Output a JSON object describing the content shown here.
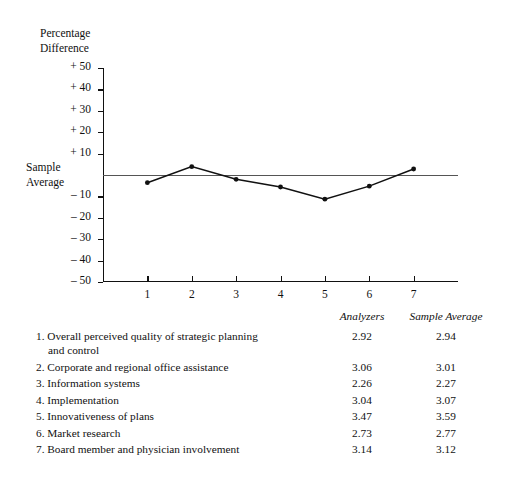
{
  "chart_data": {
    "type": "line",
    "title": "",
    "ylabel": "Percentage Difference",
    "xlabel": "",
    "zero_line_label": "Sample Average",
    "ylim": [
      -50,
      50
    ],
    "ytick_labels": [
      "+ 50",
      "+ 40",
      "+ 30",
      "+ 20",
      "+ 10",
      "– 10",
      "– 20",
      "– 30",
      "– 40",
      "– 50"
    ],
    "ytick_values": [
      50,
      40,
      30,
      20,
      10,
      -10,
      -20,
      -30,
      -40,
      -50
    ],
    "xtick_labels": [
      "1",
      "2",
      "3",
      "4",
      "5",
      "6",
      "7"
    ],
    "x": [
      1,
      2,
      3,
      4,
      5,
      6,
      7
    ],
    "values": [
      -3.6,
      3.9,
      -2.0,
      -5.6,
      -11.3,
      -5.2,
      2.8
    ],
    "grid": false,
    "legend": "none",
    "marker": "filled-circle",
    "line_color": "#111111"
  },
  "axis_title": "Percentage\nDifference",
  "sample_average_label": "Sample\nAverage",
  "table": {
    "headers": [
      "",
      "Analyzers",
      "Sample Average"
    ],
    "header_analyzers": "Analyzers",
    "header_sample_average": "Sample Average",
    "rows": [
      {
        "index": "1.",
        "label": "Overall perceived quality of strategic planning",
        "label_cont": "and control",
        "analyzers": "2.92",
        "sample_average": "2.94"
      },
      {
        "index": "2.",
        "label": "Corporate and regional office assistance",
        "label_cont": "",
        "analyzers": "3.06",
        "sample_average": "3.01"
      },
      {
        "index": "3.",
        "label": "Information systems",
        "label_cont": "",
        "analyzers": "2.26",
        "sample_average": "2.27"
      },
      {
        "index": "4.",
        "label": "Implementation",
        "label_cont": "",
        "analyzers": "3.04",
        "sample_average": "3.07"
      },
      {
        "index": "5.",
        "label": "Innovativeness of plans",
        "label_cont": "",
        "analyzers": "3.47",
        "sample_average": "3.59"
      },
      {
        "index": "6.",
        "label": "Market research",
        "label_cont": "",
        "analyzers": "2.73",
        "sample_average": "2.77"
      },
      {
        "index": "7.",
        "label": "Board member and physician involvement",
        "label_cont": "",
        "analyzers": "3.14",
        "sample_average": "3.12"
      }
    ]
  }
}
